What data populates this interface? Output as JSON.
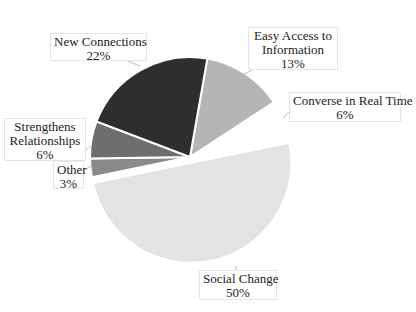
{
  "chart_data": {
    "type": "pie",
    "title": "",
    "slices": [
      {
        "label": "Easy Access to Information",
        "value": 13,
        "pct_text": "13%",
        "color": "#b5b5b5",
        "explode": 0
      },
      {
        "label": "Converse in Real Time",
        "value": 6,
        "pct_text": "6%",
        "color": "#ffffff",
        "explode": 6
      },
      {
        "label": "Social Change",
        "value": 50,
        "pct_text": "50%",
        "color": "#e3e3e3",
        "explode": 6
      },
      {
        "label": "Other",
        "value": 3,
        "pct_text": "3%",
        "color": "#8a8a8a",
        "explode": 0
      },
      {
        "label": "Strengthens Relationships",
        "value": 6,
        "pct_text": "6%",
        "color": "#6e6e6e",
        "explode": 0
      },
      {
        "label": "New Connections",
        "value": 22,
        "pct_text": "22%",
        "color": "#2e2e2e",
        "explode": 0
      }
    ],
    "start_angle_deg": 10,
    "direction": "clockwise",
    "legend": "none",
    "data_labels": "callout boxes with category name and percentage"
  },
  "layout": {
    "center": [
      190,
      157
    ],
    "radius": 100,
    "separator_color": "#ffffff",
    "separator_width": 2
  },
  "labels": [
    {
      "key": "new_connections",
      "lines": [
        "New Connections",
        "22%"
      ],
      "box": [
        50,
        33,
        97,
        28
      ],
      "leader": [
        [
          128,
          61
        ],
        [
          140,
          66
        ]
      ]
    },
    {
      "key": "easy_access",
      "lines": [
        "Easy Access to",
        "Information",
        "13%"
      ],
      "box": [
        248,
        27,
        90,
        43
      ],
      "leader": [
        [
          252,
          70
        ],
        [
          244,
          74
        ]
      ]
    },
    {
      "key": "converse",
      "lines": [
        "Converse in Real Time",
        "6%"
      ],
      "box": [
        289,
        92,
        112,
        30
      ],
      "leader": [
        [
          289,
          112
        ],
        [
          283,
          118
        ]
      ]
    },
    {
      "key": "strengthens",
      "lines": [
        "Strengthens",
        "Relationships",
        "6%"
      ],
      "box": [
        4,
        118,
        82,
        43
      ],
      "leader": [
        [
          86,
          150
        ],
        [
          91,
          146
        ]
      ]
    },
    {
      "key": "other",
      "lines": [
        "Other",
        "3%"
      ],
      "box": [
        53,
        161,
        31,
        28
      ],
      "leader": [
        [
          84,
          170
        ],
        [
          91,
          166
        ]
      ]
    },
    {
      "key": "social_change",
      "lines": [
        "Social Change",
        "50%"
      ],
      "box": [
        199,
        270,
        78,
        30
      ],
      "leader": [
        [
          236,
          270
        ],
        [
          236,
          266
        ]
      ]
    }
  ]
}
